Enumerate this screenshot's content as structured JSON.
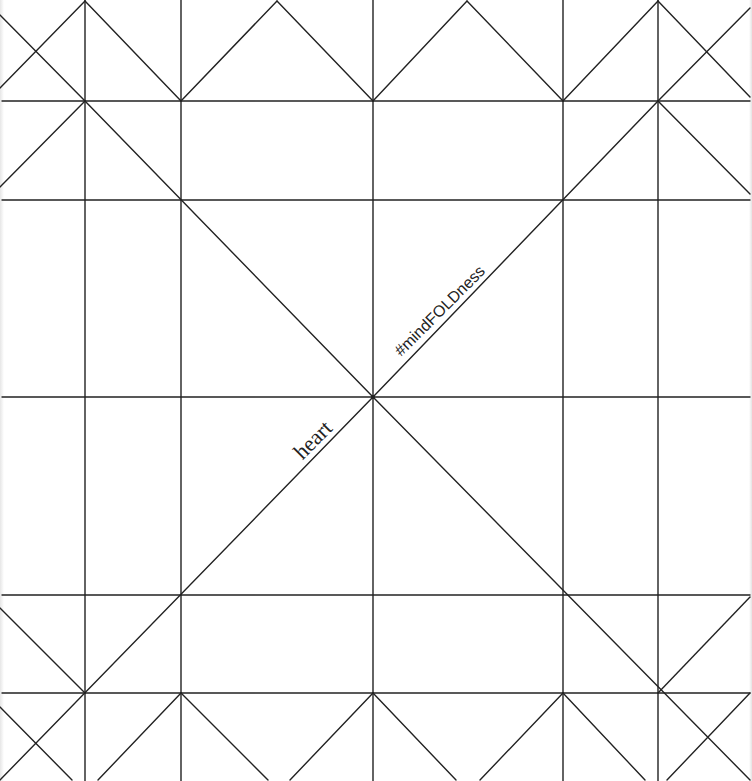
{
  "diagram": {
    "type": "origami-crease-pattern",
    "canvas": {
      "width": 752,
      "height": 781
    },
    "line_color": "#222222",
    "background": "#ffffff",
    "grid": {
      "vertical_x": [
        85,
        181,
        373,
        563,
        658
      ],
      "horizontal_y": [
        101,
        200,
        397,
        595,
        693
      ]
    },
    "center": [
      373,
      397
    ],
    "diagonals": [
      [
        0,
        15,
        85,
        101
      ],
      [
        0,
        88,
        85,
        1
      ],
      [
        85,
        1,
        181,
        101
      ],
      [
        181,
        101,
        277,
        1
      ],
      [
        277,
        1,
        373,
        101
      ],
      [
        373,
        101,
        467,
        1
      ],
      [
        467,
        1,
        563,
        101
      ],
      [
        563,
        101,
        658,
        1
      ],
      [
        658,
        1,
        750,
        97
      ],
      [
        658,
        101,
        750,
        8
      ],
      [
        0,
        187,
        85,
        101
      ],
      [
        85,
        101,
        373,
        397
      ],
      [
        373,
        397,
        750,
        780
      ],
      [
        658,
        101,
        373,
        397
      ],
      [
        373,
        397,
        0,
        780
      ],
      [
        658,
        101,
        750,
        194
      ],
      [
        0,
        608,
        85,
        693
      ],
      [
        658,
        693,
        750,
        597
      ],
      [
        0,
        707,
        72,
        780
      ],
      [
        181,
        693,
        98,
        780
      ],
      [
        181,
        693,
        268,
        780
      ],
      [
        373,
        693,
        290,
        780
      ],
      [
        373,
        693,
        456,
        780
      ],
      [
        563,
        693,
        480,
        780
      ],
      [
        563,
        693,
        645,
        780
      ],
      [
        750,
        693,
        667,
        780
      ]
    ],
    "labels": {
      "heart": {
        "text": "heart",
        "x": 313,
        "y": 440,
        "rotation": -45
      },
      "hashtag": {
        "text": "#mindFOLDness",
        "x": 440,
        "y": 311,
        "rotation": -45
      }
    }
  }
}
